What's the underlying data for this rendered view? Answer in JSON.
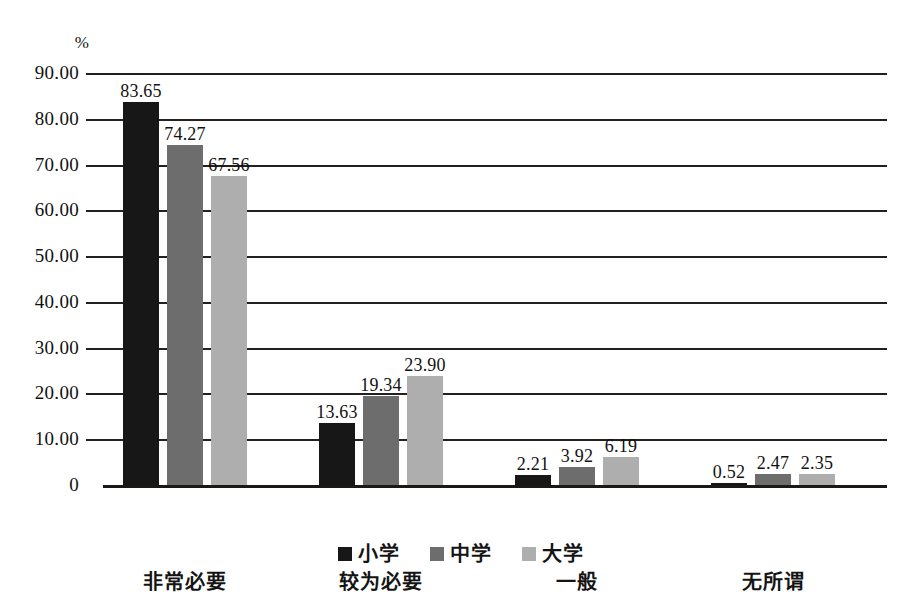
{
  "chart_data": {
    "type": "bar",
    "title": "",
    "subtitle": "",
    "xlabel": "",
    "ylabel": "%",
    "unit_label": "%",
    "categories": [
      "非常必要",
      "较为必要",
      "一般",
      "无所谓"
    ],
    "series": [
      {
        "name": "小学",
        "color": "#171717",
        "values": [
          83.65,
          74.27,
          2.21,
          0.52
        ]
      },
      {
        "name": "中学",
        "color": "#6d6d6d",
        "values": [
          74.27,
          19.34,
          3.92,
          2.47
        ]
      },
      {
        "name": "大学",
        "color": "#aeaeae",
        "values": [
          67.56,
          23.9,
          6.19,
          2.35
        ]
      }
    ],
    "grouped_values": [
      [
        "83.65",
        "74.27",
        "67.56"
      ],
      [
        "13.63",
        "19.34",
        "23.90"
      ],
      [
        "2.21",
        "3.92",
        "6.19"
      ],
      [
        "0.52",
        "2.47",
        "2.35"
      ]
    ],
    "grouped_numeric": [
      [
        83.65,
        74.27,
        67.56
      ],
      [
        13.63,
        19.34,
        23.9
      ],
      [
        2.21,
        3.92,
        6.19
      ],
      [
        0.52,
        2.47,
        2.35
      ]
    ],
    "ylim": [
      0,
      90
    ],
    "ytick_labels": [
      "90.00",
      "80.00",
      "70.00",
      "60.00",
      "50.00",
      "40.00",
      "30.00",
      "20.00",
      "10.00",
      "0"
    ],
    "ytick_values": [
      90,
      80,
      70,
      60,
      50,
      40,
      30,
      20,
      10,
      0
    ],
    "grid": true,
    "grid_axis": "y",
    "legend_position": "bottom",
    "legend": [
      "小学",
      "中学",
      "大学"
    ]
  }
}
